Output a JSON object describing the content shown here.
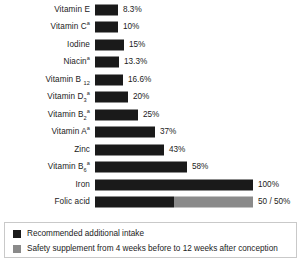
{
  "chart_data": {
    "type": "bar",
    "orientation": "horizontal",
    "title": "",
    "subtitle": "",
    "xlabel": "",
    "ylabel": "",
    "grid": false,
    "xlim": [
      0,
      100
    ],
    "axis_visible": false,
    "tick_labels": [],
    "legend_position": "bottom",
    "colors": {
      "primary": "#1a1a1a",
      "secondary": "#8a8a8a",
      "text": "#1b1b1b",
      "legend_border": "#c9c9c9",
      "background": "#ffffff"
    },
    "categories": [
      "Vitamin E",
      "Vitamin C",
      "Iodine",
      "Niacin",
      "Vitamin B12",
      "Vitamin D3",
      "Vitamin B2",
      "Vitamin A",
      "Zinc",
      "Vitamin B6",
      "Iron",
      "Folic acid"
    ],
    "values": [
      8.3,
      10,
      15,
      13.3,
      16.6,
      20,
      25,
      37,
      43,
      58,
      100,
      100
    ],
    "series": [
      {
        "name": "Recommended additional intake",
        "color": "#1a1a1a",
        "values": [
          8.3,
          10,
          15,
          13.3,
          16.6,
          20,
          25,
          37,
          43,
          58,
          100,
          50
        ]
      },
      {
        "name": "Safety supplement from 4 weeks before to 12 weeks after conception",
        "color": "#8a8a8a",
        "values": [
          0,
          0,
          0,
          0,
          0,
          0,
          0,
          0,
          0,
          0,
          0,
          50
        ]
      }
    ],
    "data_labels": [
      "8.3%",
      "10%",
      "15%",
      "13.3%",
      "16.6%",
      "20%",
      "25%",
      "37%",
      "43%",
      "58%",
      "100%",
      "50 / 50%"
    ]
  },
  "rows": [
    {
      "label_main": "Vitamin E",
      "sup": "",
      "sub": "",
      "value_label": "8.3%",
      "primary_px": 23,
      "secondary_px": 0,
      "top": 1
    },
    {
      "label_main": "Vitamin C",
      "sup": "a",
      "sub": "",
      "value_label": "10%",
      "primary_px": 23,
      "secondary_px": 0,
      "top": 18.5
    },
    {
      "label_main": "Iodine",
      "sup": "",
      "sub": "",
      "value_label": "15%",
      "primary_px": 29,
      "secondary_px": 0,
      "top": 36
    },
    {
      "label_main": "Niacin",
      "sup": "a",
      "sub": "",
      "value_label": "13.3%",
      "primary_px": 24,
      "secondary_px": 0,
      "top": 53.5
    },
    {
      "label_main": "Vitamin B ",
      "sup": "",
      "sub": "12",
      "value_label": "16.6%",
      "primary_px": 28,
      "secondary_px": 0,
      "top": 71
    },
    {
      "label_main": "Vitamin D",
      "sup": "a",
      "sub": "3",
      "value_label": "20%",
      "primary_px": 33,
      "secondary_px": 0,
      "top": 88.5
    },
    {
      "label_main": "Vitamin B",
      "sup": "a",
      "sub": "2",
      "value_label": "25%",
      "primary_px": 43,
      "secondary_px": 0,
      "top": 106
    },
    {
      "label_main": "Vitamin A",
      "sup": "a",
      "sub": "",
      "value_label": "37%",
      "primary_px": 60,
      "secondary_px": 0,
      "top": 123.5
    },
    {
      "label_main": "Zinc",
      "sup": "",
      "sub": "",
      "value_label": "43%",
      "primary_px": 69,
      "secondary_px": 0,
      "top": 141
    },
    {
      "label_main": "Vitamin B",
      "sup": "a",
      "sub": "6",
      "value_label": "58%",
      "primary_px": 92,
      "secondary_px": 0,
      "top": 158.5
    },
    {
      "label_main": "Iron",
      "sup": "",
      "sub": "",
      "value_label": "100%",
      "primary_px": 158,
      "secondary_px": 0,
      "top": 176
    },
    {
      "label_main": "Folic acid",
      "sup": "",
      "sub": "",
      "value_label": "50 / 50%",
      "primary_px": 79,
      "secondary_px": 79,
      "top": 193.5
    }
  ],
  "legend": {
    "items": [
      {
        "label": "Recommended additional intake",
        "swatch": "primary"
      },
      {
        "label": "Safety supplement from 4 weeks before to 12 weeks after conception",
        "swatch": "secondary"
      }
    ]
  }
}
